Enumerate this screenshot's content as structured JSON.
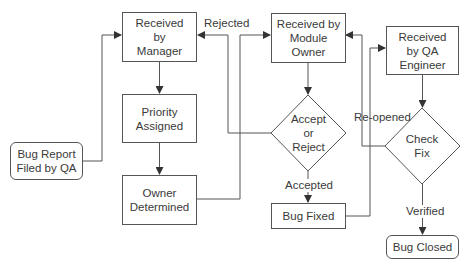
{
  "diagram": {
    "type": "flowchart",
    "nodes": {
      "bug_report": {
        "label": "Bug Report Filed by QA",
        "line1": "Bug Report",
        "line2": "Filed by QA",
        "shape": "rounded-rect"
      },
      "received_manager": {
        "label": "Received by Manager",
        "line1": "Received",
        "line2": "by",
        "line3": "Manager",
        "shape": "rect"
      },
      "priority": {
        "label": "Priority Assigned",
        "line1": "Priority",
        "line2": "Assigned",
        "shape": "rect"
      },
      "owner_determined": {
        "label": "Owner Determined",
        "line1": "Owner",
        "line2": "Determined",
        "shape": "rect"
      },
      "received_module_owner": {
        "label": "Received by Module Owner",
        "line1": "Received by",
        "line2": "Module",
        "line3": "Owner",
        "shape": "rect"
      },
      "accept_reject": {
        "label": "Accept or Reject",
        "line1": "Accept",
        "line2": "or",
        "line3": "Reject",
        "shape": "diamond"
      },
      "bug_fixed": {
        "label": "Bug Fixed",
        "shape": "rect"
      },
      "received_qa": {
        "label": "Received by QA Engineer",
        "line1": "Received",
        "line2": "by QA",
        "line3": "Engineer",
        "shape": "rect"
      },
      "check_fix": {
        "label": "Check Fix",
        "line1": "Check",
        "line2": "Fix",
        "shape": "diamond"
      },
      "bug_closed": {
        "label": "Bug Closed",
        "shape": "rounded-rect"
      }
    },
    "edge_labels": {
      "rejected": "Rejected",
      "accepted": "Accepted",
      "reopened": "Re-opened",
      "verified": "Verified"
    },
    "edges": [
      {
        "from": "bug_report",
        "to": "received_manager",
        "label": ""
      },
      {
        "from": "received_manager",
        "to": "priority",
        "label": ""
      },
      {
        "from": "priority",
        "to": "owner_determined",
        "label": ""
      },
      {
        "from": "owner_determined",
        "to": "received_module_owner",
        "label": ""
      },
      {
        "from": "received_module_owner",
        "to": "accept_reject",
        "label": ""
      },
      {
        "from": "accept_reject",
        "to": "received_manager",
        "label": "Rejected"
      },
      {
        "from": "accept_reject",
        "to": "bug_fixed",
        "label": "Accepted"
      },
      {
        "from": "bug_fixed",
        "to": "received_qa",
        "label": ""
      },
      {
        "from": "received_qa",
        "to": "check_fix",
        "label": ""
      },
      {
        "from": "check_fix",
        "to": "received_module_owner",
        "label": "Re-opened"
      },
      {
        "from": "check_fix",
        "to": "bug_closed",
        "label": "Verified"
      }
    ],
    "colors": {
      "stroke": "#555555",
      "text": "#3a3a3a",
      "background": "#ffffff"
    }
  }
}
